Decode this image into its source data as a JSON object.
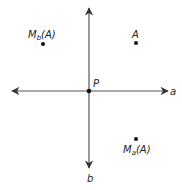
{
  "diagram": {
    "type": "reflection",
    "colors": {
      "stroke": "#444444",
      "point": "#111111",
      "background": "#ffffff"
    },
    "axes": {
      "a": {
        "label": "a",
        "orientation": "horizontal"
      },
      "b": {
        "label": "b",
        "orientation": "vertical"
      }
    },
    "points": {
      "P": {
        "label": "P"
      },
      "A": {
        "label": "A"
      },
      "Mb": {
        "label_main": "M",
        "label_sub": "b",
        "label_tail": "(A)"
      },
      "Ma": {
        "label_main": "M",
        "label_sub": "a",
        "label_tail": "(A)"
      }
    }
  }
}
